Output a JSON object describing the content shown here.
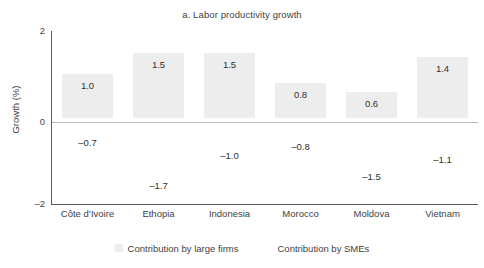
{
  "chart_data": {
    "type": "bar",
    "title": "a. Labor productivity growth",
    "xlabel": "",
    "ylabel": "Growth (%)",
    "ylim": [
      -2,
      2
    ],
    "yticks": [
      "2",
      "0",
      "–2"
    ],
    "grid": false,
    "legend_position": "bottom",
    "categories": [
      "Côte d’Ivoire",
      "Ethopia",
      "Indonesia",
      "Morocco",
      "Moldova",
      "Vietnam"
    ],
    "series": [
      {
        "name": "Contribution by large firms",
        "color": "#ededed",
        "values": [
          1.0,
          1.5,
          1.5,
          0.8,
          0.6,
          1.4
        ],
        "labels": [
          "1.0",
          "1.5",
          "1.5",
          "0.8",
          "0.6",
          "1.4"
        ]
      },
      {
        "name": "Contribution by SMEs",
        "color": "#ffffff",
        "values": [
          -0.7,
          -1.7,
          -1.0,
          -0.8,
          -1.5,
          -1.1
        ],
        "labels": [
          "–0.7",
          "–1.7",
          "–1.0",
          "–0.8",
          "–1.5",
          "–1.1"
        ]
      }
    ],
    "colors": {
      "bar_positive": "#ededed",
      "bar_negative": "#ffffff",
      "axis": "#5b5b5b",
      "zero_line": "#b9b9b9",
      "text": "#3f3f3f"
    }
  },
  "legend": {
    "items": [
      {
        "label": "Contribution by large firms"
      },
      {
        "label": "Contribution by SMEs"
      }
    ]
  }
}
